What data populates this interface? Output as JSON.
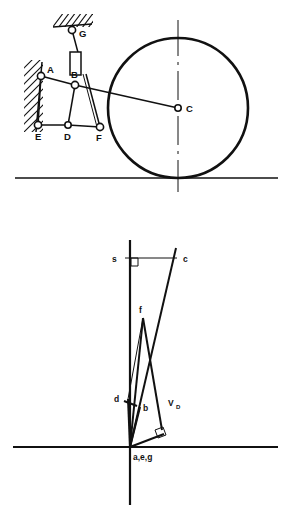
{
  "figure": {
    "panels": [
      {
        "id": "mechanism-diagram",
        "name": "Linkage mechanism with rolling wheel",
        "ground_line": {
          "y": 178,
          "x1": 15,
          "x2": 278
        },
        "wheel": {
          "label": "C",
          "center": {
            "x": 178,
            "y": 108
          },
          "radius": 70,
          "centerline": "vertical dash-dot"
        },
        "joints": [
          {
            "label": "A",
            "x": 41,
            "y": 76,
            "label_dx": 6,
            "label_dy": -5,
            "fixed": true
          },
          {
            "label": "B",
            "x": 75,
            "y": 85,
            "label_dx": -2,
            "label_dy": -9,
            "fixed": false
          },
          {
            "label": "C",
            "x": 178,
            "y": 108,
            "label_dx": 8,
            "label_dy": 3,
            "fixed": false
          },
          {
            "label": "D",
            "x": 68,
            "y": 125,
            "label_dx": -2,
            "label_dy": 14,
            "fixed": false
          },
          {
            "label": "E",
            "x": 38,
            "y": 125,
            "label_dx": -2,
            "label_dy": 14,
            "fixed": true
          },
          {
            "label": "F",
            "x": 100,
            "y": 127,
            "label_dx": -2,
            "label_dy": 14,
            "fixed": false
          },
          {
            "label": "G",
            "x": 72,
            "y": 30,
            "label_dx": 7,
            "label_dy": 6,
            "fixed": true
          }
        ],
        "links": [
          "A-B",
          "B-C",
          "A-E",
          "E-D",
          "D-F",
          "D-B",
          "B-F",
          "F-G-slider"
        ],
        "supports": [
          {
            "name": "wall-hatch-left",
            "x": 24,
            "y": 62,
            "w": 18,
            "h": 68
          },
          {
            "name": "ceiling-hatch-G",
            "x": 54,
            "y": 15,
            "w": 38,
            "h": 12
          }
        ],
        "slider_block": {
          "x": 68,
          "y": 56,
          "w": 11,
          "h": 20
        }
      },
      {
        "id": "velocity-polygon",
        "name": "Velocity polygon (vector diagram)",
        "pole_label": "a,e,g",
        "pole": {
          "x": 130,
          "y": 447
        },
        "axis_vertical": {
          "x": 130,
          "y1": 240,
          "y2": 505
        },
        "axis_horizontal": {
          "y": 447,
          "x1": 13,
          "x2": 278
        },
        "points": [
          {
            "label": "s",
            "x": 130,
            "y": 258,
            "label_dx": -11,
            "label_dy": 3
          },
          {
            "label": "c",
            "x": 178,
            "y": 258,
            "label_dx": 7,
            "label_dy": 3
          },
          {
            "label": "f",
            "x": 143,
            "y": 318,
            "label_dx": -3,
            "label_dy": -6
          },
          {
            "label": "d",
            "x": 130,
            "y": 400,
            "label_dx": -11,
            "label_dy": 3
          },
          {
            "label": "b",
            "x": 140,
            "y": 407,
            "label_dx": 6,
            "label_dy": 4
          }
        ],
        "vector_label": {
          "text": "V",
          "subscript": "D",
          "x": 173,
          "y": 403
        },
        "right_angle_markers": [
          {
            "at": "s",
            "x": 130,
            "y": 258
          },
          {
            "at": "VD-tip",
            "x": 163,
            "y": 428
          }
        ],
        "vectors": [
          "a-c (pole to c)",
          "a-s (pole to s along vertical axis)",
          "s-c (horizontal, perpendicular marker at s)",
          "a-f",
          "f-b",
          "a-b",
          "a-d",
          "d-f",
          "a-VD (velocity of D, with right-angle marker)"
        ]
      }
    ]
  }
}
